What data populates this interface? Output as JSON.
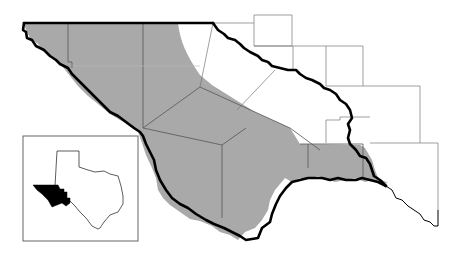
{
  "map": {
    "title": "",
    "region_description": "Trans-Pecos region of Texas with shaded study area counties",
    "colors": {
      "shaded_area": "#a9a9a9",
      "county_lines": "#555555",
      "region_border": "#000000",
      "background": "#ffffff",
      "inset_highlight": "#000000"
    },
    "legend": [],
    "labels": []
  },
  "inset": {
    "description": "Texas state outline locator with highlighted western region",
    "highlight_color": "#000000"
  }
}
